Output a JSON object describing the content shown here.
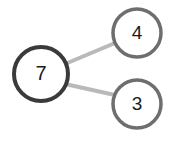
{
  "diagram": {
    "type": "node-link-graph",
    "title": "",
    "background_color": "#ffffff",
    "nodes": [
      {
        "id": "root",
        "label": "7",
        "cx": 41,
        "cy": 74,
        "r": 27,
        "stroke_color": "#3a3a3a",
        "stroke_width": 4,
        "fill_color": "#ffffff",
        "text_color": "#1a1a1a"
      },
      {
        "id": "child-top",
        "label": "4",
        "cx": 137,
        "cy": 33,
        "r": 24,
        "stroke_color": "#6e6e6e",
        "stroke_width": 3.5,
        "fill_color": "#ffffff",
        "text_color": "#1a1a1a"
      },
      {
        "id": "child-bottom",
        "label": "3",
        "cx": 137,
        "cy": 104,
        "r": 24,
        "stroke_color": "#6e6e6e",
        "stroke_width": 3.5,
        "fill_color": "#ffffff",
        "text_color": "#1a1a1a"
      }
    ],
    "edges": [
      {
        "id": "edge-root-top",
        "from": "root",
        "to": "child-top",
        "x1": 65,
        "y1": 64,
        "x2": 115,
        "y2": 43,
        "stroke_color": "#b9b9b9",
        "stroke_width": 4
      },
      {
        "id": "edge-root-bottom",
        "from": "root",
        "to": "child-bottom",
        "x1": 65,
        "y1": 84,
        "x2": 115,
        "y2": 95,
        "stroke_color": "#b9b9b9",
        "stroke_width": 4
      }
    ]
  }
}
